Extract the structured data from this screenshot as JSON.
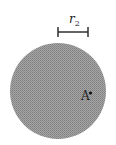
{
  "diagram": {
    "scale_bar": {
      "label": "r",
      "subscript": "2"
    },
    "point": {
      "label": "A"
    },
    "colors": {
      "circle_fill": "#9a9a9a",
      "circle_dots": "#7c7c7c",
      "ink": "#222222",
      "background": "#ffffff"
    }
  }
}
